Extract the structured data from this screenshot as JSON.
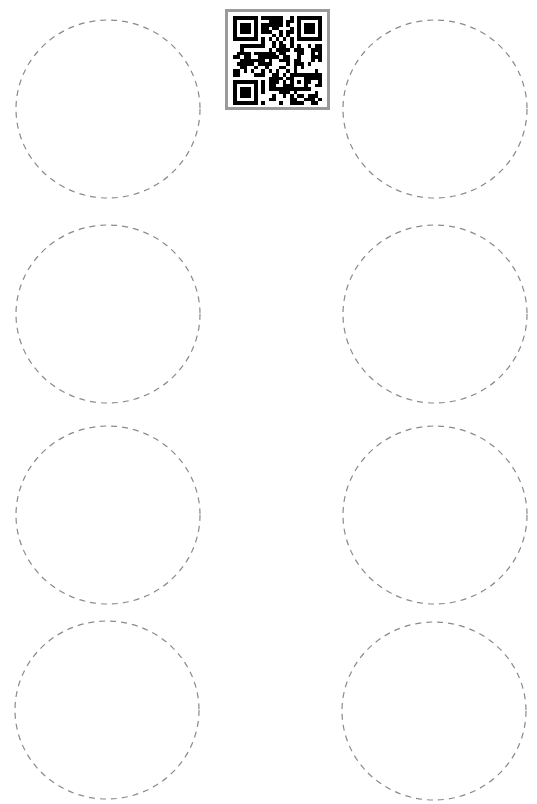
{
  "sheet": {
    "description": "Round label sheet template, 2 columns x 4 rows",
    "background": "#ffffff",
    "circle_stroke": "#8a8a8a",
    "circles": [
      {
        "id": "label-1",
        "row": 1,
        "col": 1,
        "cx": 108,
        "cy": 109,
        "rx": 92,
        "ry": 89
      },
      {
        "id": "label-2",
        "row": 1,
        "col": 2,
        "cx": 435,
        "cy": 109,
        "rx": 92,
        "ry": 89
      },
      {
        "id": "label-3",
        "row": 2,
        "col": 1,
        "cx": 108,
        "cy": 314,
        "rx": 92,
        "ry": 89
      },
      {
        "id": "label-4",
        "row": 2,
        "col": 2,
        "cx": 435,
        "cy": 314,
        "rx": 92,
        "ry": 89
      },
      {
        "id": "label-5",
        "row": 3,
        "col": 1,
        "cx": 108,
        "cy": 515,
        "rx": 92,
        "ry": 89
      },
      {
        "id": "label-6",
        "row": 3,
        "col": 2,
        "cx": 435,
        "cy": 515,
        "rx": 92,
        "ry": 89
      },
      {
        "id": "label-7",
        "row": 4,
        "col": 1,
        "cx": 107,
        "cy": 710,
        "rx": 92,
        "ry": 89
      },
      {
        "id": "label-8",
        "row": 4,
        "col": 2,
        "cx": 434,
        "cy": 711,
        "rx": 92,
        "ry": 89
      }
    ]
  },
  "qr_code": {
    "icon": "qr-code-icon",
    "border_color": "#9a9a9a",
    "module_color": "#000000"
  }
}
